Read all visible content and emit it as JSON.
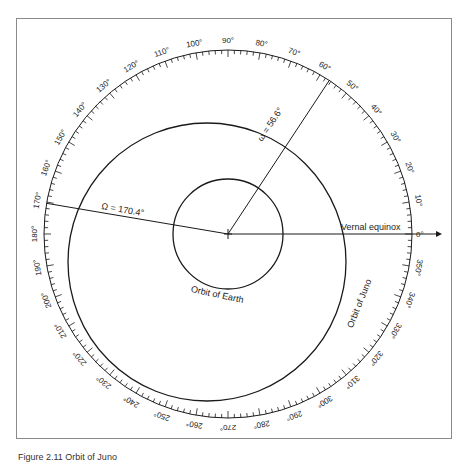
{
  "figure": {
    "center": [
      228,
      234
    ],
    "scale_radius": 184,
    "earth_orbit": {
      "cx": 228,
      "cy": 234,
      "r": 55,
      "label": "Orbit of Earth"
    },
    "juno_orbit": {
      "cx": 207,
      "cy": 262,
      "r": 139,
      "label": "Orbit of Juno"
    },
    "vernal_equinox": {
      "label": "Vernal equinox",
      "angle_label": "0°"
    },
    "node_line": {
      "label": "Ω = 170.4°",
      "angle_deg": 170.4
    },
    "perihelion_line": {
      "label": "ω = 56.6°",
      "angle_deg": 56.6
    },
    "scale_labels": [
      "0°",
      "10°",
      "20°",
      "30°",
      "40°",
      "50°",
      "60°",
      "70°",
      "80°",
      "90°",
      "100°",
      "110°",
      "120°",
      "130°",
      "140°",
      "150°",
      "160°",
      "170°",
      "180°",
      "190°",
      "200°",
      "210°",
      "220°",
      "230°",
      "240°",
      "250°",
      "260°",
      "270°",
      "280°",
      "290°",
      "300°",
      "310°",
      "320°",
      "330°",
      "340°",
      "350°"
    ],
    "colors": {
      "line": "#1a1a1a",
      "frame": "#8a8a8a"
    }
  },
  "caption": "Figure 2.11  Orbit of Juno"
}
